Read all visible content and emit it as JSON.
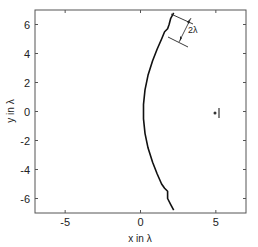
{
  "chart_data": {
    "type": "line",
    "title": "",
    "xlabel": "x in λ",
    "ylabel": "y in λ",
    "xlim": [
      -7,
      7
    ],
    "ylim": [
      -7,
      7
    ],
    "grid": false,
    "legend": null,
    "x_ticks": [
      -5,
      0,
      5
    ],
    "x_tick_labels": [
      "-5",
      "0",
      "5"
    ],
    "y_ticks": [
      -6,
      -4,
      -2,
      0,
      2,
      4,
      6
    ],
    "y_tick_labels": [
      "-6",
      "-4",
      "-2",
      "0",
      "2",
      "4",
      "6"
    ],
    "series": [
      {
        "name": "wavefront",
        "color": "#111111",
        "points": [
          [
            2.2,
            6.8
          ],
          [
            2.0,
            6.4
          ],
          [
            1.9,
            6.0
          ],
          [
            1.8,
            5.7
          ],
          [
            1.6,
            5.5
          ],
          [
            1.4,
            5.0
          ],
          [
            1.1,
            4.3
          ],
          [
            0.8,
            3.5
          ],
          [
            0.5,
            2.5
          ],
          [
            0.3,
            1.5
          ],
          [
            0.2,
            0.5
          ],
          [
            0.2,
            0.0
          ],
          [
            0.2,
            -0.5
          ],
          [
            0.3,
            -1.5
          ],
          [
            0.5,
            -2.5
          ],
          [
            0.8,
            -3.5
          ],
          [
            1.1,
            -4.3
          ],
          [
            1.4,
            -5.0
          ],
          [
            1.6,
            -5.3
          ],
          [
            1.8,
            -5.5
          ],
          [
            1.8,
            -6.0
          ],
          [
            2.0,
            -6.4
          ],
          [
            2.2,
            -6.8
          ]
        ]
      }
    ],
    "markers": [
      {
        "name": "source-point",
        "x": 5.0,
        "y": 0.0,
        "symbol": "dot"
      },
      {
        "name": "source-bar",
        "x": 5.3,
        "y": 0.0,
        "symbol": "vertical-bar"
      }
    ],
    "annotations": [
      {
        "text": "2λ",
        "type": "dimension-arrow",
        "from": [
          2.4,
          5.6
        ],
        "to": [
          3.3,
          7.0
        ]
      }
    ]
  }
}
